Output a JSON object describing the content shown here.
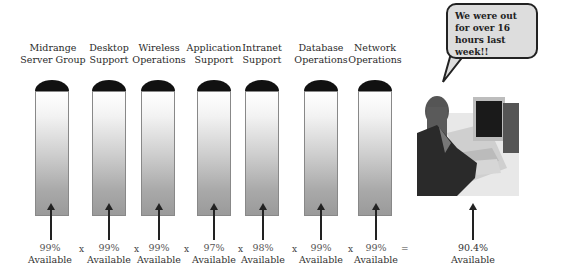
{
  "groups": [
    {
      "label_line1": "Midrange",
      "label_line2": "Server Group",
      "availability": "99%",
      "available_label": "Available"
    },
    {
      "label_line1": "Desktop",
      "label_line2": "Support",
      "availability": "99%",
      "available_label": "Available"
    },
    {
      "label_line1": "Wireless",
      "label_line2": "Operations",
      "availability": "99%",
      "available_label": "Available"
    },
    {
      "label_line1": "Application",
      "label_line2": "Support",
      "availability": "97%",
      "available_label": "Available"
    },
    {
      "label_line1": "Intranet",
      "label_line2": "Support",
      "availability": "98%",
      "available_label": "Available"
    },
    {
      "label_line1": "Database",
      "label_line2": "Operations",
      "availability": "99%",
      "available_label": "Available"
    },
    {
      "label_line1": "Network",
      "label_line2": "Operations",
      "availability": "99%",
      "available_label": "Available"
    }
  ],
  "operators": {
    "multiply": "x",
    "equals": "="
  },
  "result": {
    "availability": "90.4%",
    "available_label": "Available"
  },
  "speech_bubble": {
    "line1": "We were out",
    "line2": "for over 16",
    "line3": "hours last week!!"
  },
  "colors": {
    "dome": "#111111",
    "tube_border": "#888888",
    "bubble_fill": "#dddddd"
  }
}
